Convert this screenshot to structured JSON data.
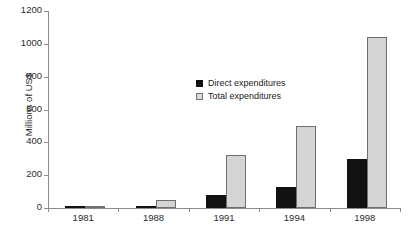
{
  "chart_data": {
    "type": "bar",
    "title": "",
    "xlabel": "",
    "ylabel": "Millions of US$",
    "categories": [
      "1981",
      "1988",
      "1991",
      "1994",
      "1998"
    ],
    "series": [
      {
        "name": "Direct expenditures",
        "color": "#111111",
        "values": [
          5,
          15,
          80,
          125,
          300
        ]
      },
      {
        "name": "Total expenditures",
        "color": "#d4d4d4",
        "values": [
          15,
          50,
          320,
          500,
          1040
        ]
      }
    ],
    "ylim": [
      0,
      1200
    ],
    "yticks": [
      0,
      200,
      400,
      600,
      800,
      1000,
      1200
    ],
    "ytick_labels": [
      "0",
      "200",
      "400",
      "600",
      "800",
      "1000",
      "1200"
    ],
    "grid": false,
    "legend_position": "inside-upper-center"
  },
  "legend": {
    "items": [
      {
        "label": "Direct expenditures"
      },
      {
        "label": "Total expenditures"
      }
    ]
  }
}
